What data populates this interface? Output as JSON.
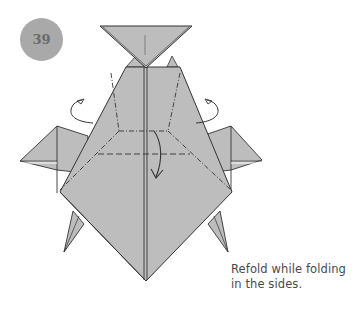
{
  "step": {
    "number": "39",
    "badge_color": "#a9a9a9",
    "number_color": "#6a6a6a"
  },
  "diagram": {
    "paper_color": "#bdbdbd",
    "line_color": "#333333",
    "fold_markings": [
      "valley-fold (dashed) horizontal line",
      "mountain-fold (dash-dot) lines forming trapezoid",
      "curved arrow down (fold flap down)",
      "left rotation arrow (fold side in behind)",
      "right rotation arrow (fold side in behind)"
    ]
  },
  "caption": {
    "line1": "Refold while folding",
    "line2": "in the sides."
  }
}
